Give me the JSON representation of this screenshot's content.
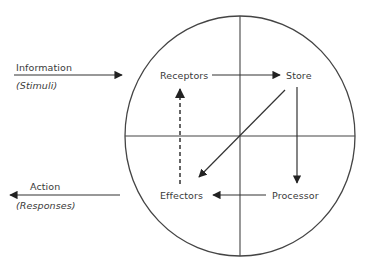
{
  "diagram": {
    "type": "information-processing-cycle",
    "inputs": {
      "label": "Information",
      "sublabel": "(Stimuli)"
    },
    "outputs": {
      "label": "Action",
      "sublabel": "(Responses)"
    },
    "nodes": [
      {
        "id": "receptors",
        "label": "Receptors"
      },
      {
        "id": "store",
        "label": "Store"
      },
      {
        "id": "processor",
        "label": "Processor"
      },
      {
        "id": "effectors",
        "label": "Effectors"
      }
    ],
    "edges": [
      {
        "from": "information",
        "to": "circle",
        "style": "solid"
      },
      {
        "from": "receptors",
        "to": "store",
        "style": "solid"
      },
      {
        "from": "store",
        "to": "processor",
        "style": "solid"
      },
      {
        "from": "store",
        "to": "effectors",
        "style": "solid"
      },
      {
        "from": "processor",
        "to": "effectors",
        "style": "solid"
      },
      {
        "from": "effectors",
        "to": "receptors",
        "style": "dashed"
      },
      {
        "from": "circle",
        "to": "action",
        "style": "solid"
      }
    ],
    "colors": {
      "stroke": "#333333",
      "text": "#3a3a3a",
      "background": "#ffffff"
    }
  }
}
